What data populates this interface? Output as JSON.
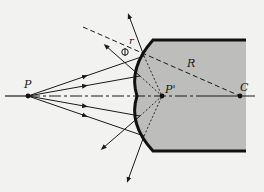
{
  "diagram": {
    "type": "optics-refraction-concave-surface",
    "colors": {
      "background": "#f2f2f0",
      "medium_fill": "#bdbdbb",
      "line": "#1a1a1a",
      "surface": "#111111"
    },
    "labels": {
      "object_point": "P",
      "image_point": "P'",
      "center_of_curvature": "C",
      "radius": "R",
      "normal_ray": "r",
      "angle": "Φ"
    },
    "points": {
      "P": [
        28,
        96
      ],
      "P_prime": [
        162,
        96
      ],
      "C": [
        240,
        96
      ]
    }
  }
}
